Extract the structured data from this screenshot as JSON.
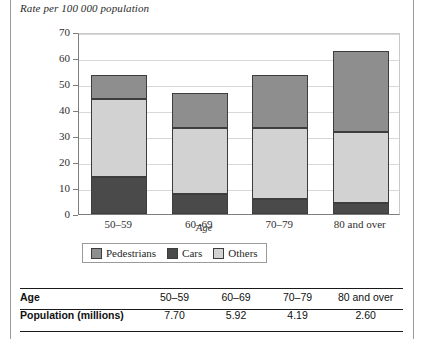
{
  "chart_caption": "Rate per 100 000 population",
  "legend": {
    "items": [
      {
        "label": "Pedestrians",
        "color": "#8e8e8e"
      },
      {
        "label": "Cars",
        "color": "#4a4a4a"
      },
      {
        "label": "Others",
        "color": "#d2d2d2"
      }
    ]
  },
  "table": {
    "rows": [
      {
        "header": "Age",
        "values": [
          "50–59",
          "60–69",
          "70–79",
          "80 and over"
        ]
      },
      {
        "header": "Population (millions)",
        "values": [
          "7.70",
          "5.92",
          "4.19",
          "2.60"
        ]
      }
    ]
  },
  "chart_data": {
    "type": "bar",
    "subtype": "stacked",
    "title": "Rate per 100 000 population",
    "xlabel": "Age",
    "ylabel": "Rate per 100 000 population",
    "categories": [
      "50–59",
      "60–69",
      "70–79",
      "80 and over"
    ],
    "series": [
      {
        "name": "Cars",
        "color": "#4a4a4a",
        "values": [
          14.3,
          7.6,
          5.9,
          4.4
        ]
      },
      {
        "name": "Others",
        "color": "#d2d2d2",
        "values": [
          30.0,
          25.6,
          27.2,
          27.3
        ]
      },
      {
        "name": "Pedestrians",
        "color": "#8e8e8e",
        "values": [
          9.2,
          13.2,
          20.4,
          31.0
        ]
      }
    ],
    "totals": [
      53.5,
      46.4,
      53.5,
      62.7
    ],
    "stack_order_bottom_to_top": [
      "Cars",
      "Others",
      "Pedestrians"
    ],
    "ylim": [
      0,
      70
    ],
    "yticks": [
      0,
      10,
      20,
      30,
      40,
      50,
      60,
      70
    ],
    "ytick_labels": [
      "0",
      "10",
      "20",
      "30",
      "40",
      "50",
      "60",
      "70"
    ],
    "grid": true,
    "legend_position": "bottom"
  }
}
